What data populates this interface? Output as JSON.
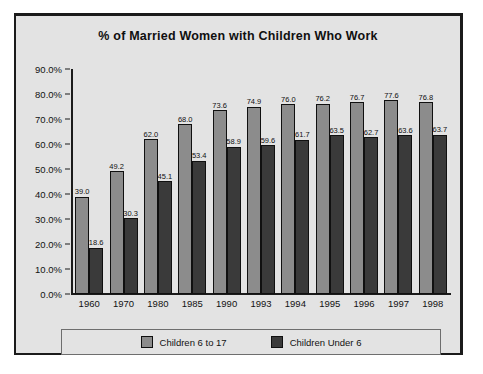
{
  "chart_data": {
    "type": "bar",
    "title": "% of Married Women with Children Who Work",
    "xlabel": "",
    "ylabel": "",
    "ylim": [
      0,
      90
    ],
    "ytick_labels": [
      "90.0%",
      "80.0%",
      "70.0%",
      "60.0%",
      "50.0%",
      "40.0%",
      "30.0%",
      "20.0%",
      "10.0%",
      "0.0%"
    ],
    "ytick_values": [
      90,
      80,
      70,
      60,
      50,
      40,
      30,
      20,
      10,
      0
    ],
    "grid": false,
    "legend_position": "bottom",
    "categories": [
      "1960",
      "1970",
      "1980",
      "1985",
      "1990",
      "1993",
      "1994",
      "1995",
      "1996",
      "1997",
      "1998"
    ],
    "series": [
      {
        "name": "Children 6 to 17",
        "color": "#8c8c8c",
        "values": [
          39.0,
          49.2,
          62.0,
          68.0,
          73.6,
          74.9,
          76.0,
          76.2,
          76.7,
          77.6,
          76.8
        ],
        "labels": [
          "39.0",
          "49.2",
          "62.0",
          "68.0",
          "73.6",
          "74.9",
          "76.0",
          "76.2",
          "76.7",
          "77.6",
          "76.8"
        ]
      },
      {
        "name": "Children Under 6",
        "color": "#3a3a3a",
        "values": [
          18.6,
          30.3,
          45.1,
          53.4,
          58.9,
          59.6,
          61.7,
          63.5,
          62.7,
          63.6,
          63.7
        ],
        "labels": [
          "18.6",
          "30.3",
          "45.1",
          "53.4",
          "58.9",
          "59.6",
          "61.7",
          "63.5",
          "62.7",
          "63.6",
          "63.7"
        ]
      }
    ]
  },
  "legend": {
    "entries": [
      {
        "label": "Children 6 to 17",
        "color": "#8c8c8c"
      },
      {
        "label": "Children Under 6",
        "color": "#3a3a3a"
      }
    ]
  },
  "colors": {
    "panel_background": "#e3e3e3",
    "frame": "#1b1b1b",
    "series_light": "#8c8c8c",
    "series_dark": "#3a3a3a",
    "text": "#121212"
  }
}
